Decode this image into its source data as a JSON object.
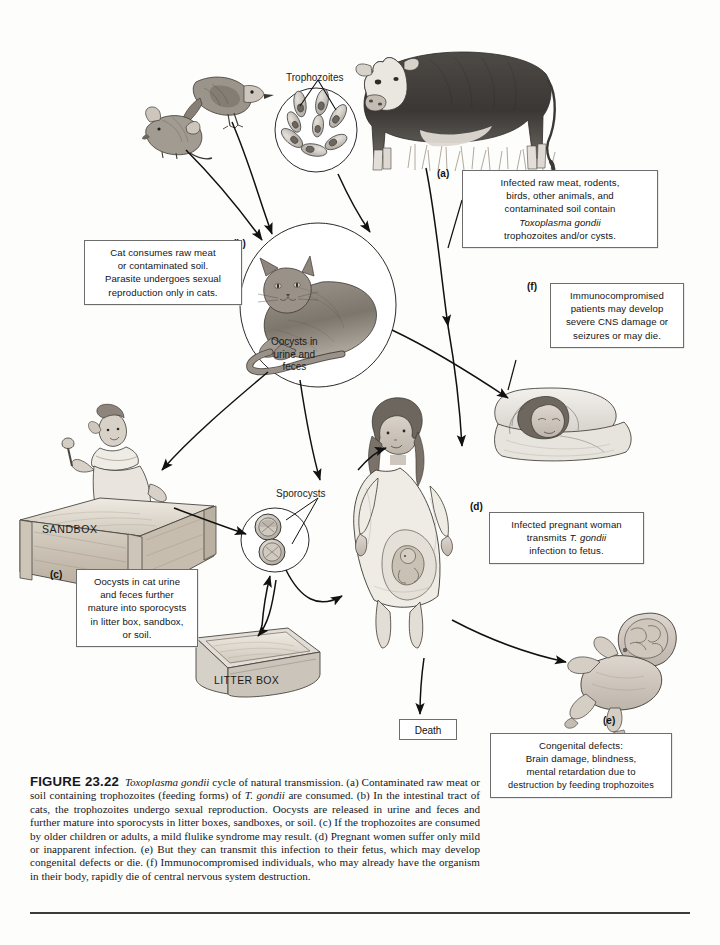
{
  "figure": {
    "number": "FIGURE 23.22",
    "title_italic": "Toxoplasma gondii",
    "caption_rest": " cycle of natural transmission. (a) Contaminated raw meat or soil containing trophozoites (feeding forms) of ",
    "caption_species_short": "T. gondii",
    "caption_tail": " are consumed. (b) In the intestinal tract of cats, the trophozoites undergo sexual reproduction. Oocysts are released in urine and feces and further mature into sporocysts in litter boxes, sandboxes, or soil. (c) If the trophozoites are consumed by older children or adults, a mild flulike syndrome may result. (d) Pregnant women suffer only mild or inapparent infection. (e) But they can transmit this infection to their fetus, which may develop congenital defects or die. (f) Immunocompromised individuals, who may already have the organism in their body, rapidly die of central nervous system destruction."
  },
  "labels": {
    "trophozoites": "Trophozoites",
    "oocysts_circle": "Oocysts in\nurine and\nfeces",
    "sporocysts": "Sporocysts",
    "sandbox": "SANDBOX",
    "litter_box": "LITTER BOX",
    "death": "Death"
  },
  "markers": {
    "a": "(a)",
    "b": "(b)",
    "c": "(c)",
    "d": "(d)",
    "e": "(e)",
    "f": "(f)"
  },
  "callouts": {
    "a": {
      "line1": "Infected raw meat, rodents,",
      "line2": "birds, other animals, and",
      "line3": "contaminated soil contain",
      "line4_italic": "Toxoplasma gondii",
      "line5": "trophozoites and/or cysts."
    },
    "b": {
      "line1": "Cat consumes raw meat",
      "line2": "or contaminated soil.",
      "line3": "Parasite undergoes sexual",
      "line4": "reproduction only in cats."
    },
    "c": {
      "line1": "Oocysts in cat urine",
      "line2": "and feces further",
      "line3": "mature into sporocysts",
      "line4": "in litter box, sandbox,",
      "line5": "or soil."
    },
    "d": {
      "line1": "Infected pregnant woman",
      "line2_pre": "transmits ",
      "line2_italic": "T. gondii",
      "line3": "infection to fetus."
    },
    "e": {
      "line1": "Congenital defects:",
      "line2": "Brain damage, blindness,",
      "line3": "mental retardation due to",
      "line4": "destruction by feeding trophozoites"
    },
    "f": {
      "line1": "Immunocompromised",
      "line2": "patients may develop",
      "line3": "severe CNS damage or",
      "line4": "seizures or may die."
    }
  },
  "illustrations": {
    "cow": "cow-illustration",
    "bird": "bird-illustration",
    "mouse": "mouse-illustration",
    "trophozoite_cluster": "trophozoite-cluster-illustration",
    "cat": "cat-illustration",
    "child_in_sandbox": "child-in-sandbox-illustration",
    "sporocyst_cluster": "sporocyst-cluster-illustration",
    "litter_box": "litter-box-illustration",
    "pregnant_woman": "pregnant-woman-illustration",
    "patient_in_bed": "patient-in-bed-illustration",
    "infant": "infant-illustration"
  },
  "colors": {
    "ink": "#1a1a1a",
    "box_border": "#6d6d6d",
    "page": "#fdfdfb",
    "art_gray": "#8d8d8d"
  }
}
